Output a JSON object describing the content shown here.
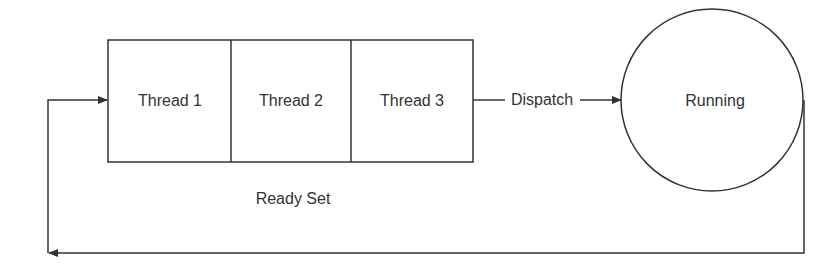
{
  "diagram": {
    "ready_set": {
      "label": "Ready Set",
      "threads": [
        "Thread 1",
        "Thread 2",
        "Thread 3"
      ]
    },
    "dispatch_label": "Dispatch",
    "running_label": "Running",
    "colors": {
      "stroke": "#333333",
      "background": "#ffffff"
    }
  }
}
